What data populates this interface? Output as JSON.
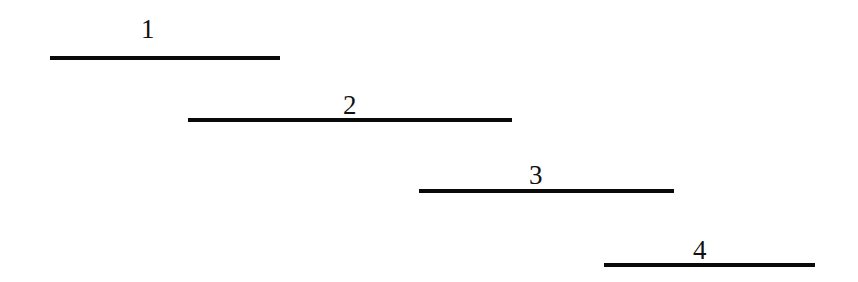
{
  "diagram": {
    "type": "staggered-horizontal-segments",
    "background": "#ffffff",
    "line_color": "#0a0a0a",
    "label_color": "#111111",
    "segments": [
      {
        "label": "1",
        "x_start": 50,
        "x_end": 280,
        "y": 58,
        "label_x": 146,
        "label_y": 16
      },
      {
        "label": "2",
        "x_start": 188,
        "x_end": 512,
        "y": 120,
        "label_x": 351,
        "label_y": 92
      },
      {
        "label": "3",
        "x_start": 419,
        "x_end": 674,
        "y": 191,
        "label_x": 536,
        "label_y": 162
      },
      {
        "label": "4",
        "x_start": 604,
        "x_end": 815,
        "y": 265,
        "label_x": 700,
        "label_y": 237
      }
    ]
  }
}
